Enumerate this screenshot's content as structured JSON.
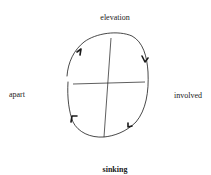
{
  "diagram": {
    "type": "cycle-with-quadrants",
    "labels": {
      "top": "elevation",
      "left": "apart",
      "right": "involved",
      "bottom": "sinking"
    },
    "direction": "clockwise",
    "arrow_count": 4,
    "colors": {
      "stroke": "#1a1a1a",
      "background": "#ffffff"
    }
  }
}
